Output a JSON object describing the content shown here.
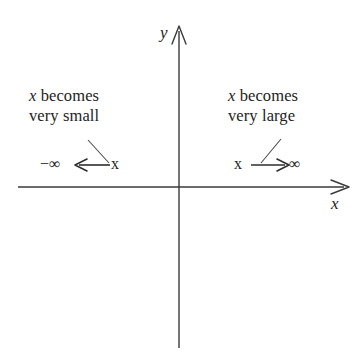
{
  "figure": {
    "type": "coordinate-axes-limit-diagram",
    "background_color": "#ffffff",
    "ink_color": "#232323"
  },
  "axes": {
    "x_axis_label": "x",
    "y_axis_label": "y",
    "origin": {
      "x": 179,
      "y": 187
    },
    "x_axis": {
      "start_x": 18,
      "end_x": 348,
      "y": 187,
      "arrowhead": "right"
    },
    "y_axis": {
      "x": 179,
      "start_y": 26,
      "end_y": 348,
      "arrowhead": "up"
    }
  },
  "annotations": {
    "left": {
      "line1_var": "x",
      "line1_rest": " becomes",
      "line2": "very small",
      "leader_line": {
        "x1": 88,
        "y1": 140,
        "x2": 109,
        "y2": 163
      }
    },
    "right": {
      "line1_var": "x",
      "line1_rest": " becomes",
      "line2": "very large",
      "leader_line": {
        "x1": 281,
        "y1": 139,
        "x2": 261,
        "y2": 163
      }
    }
  },
  "limits": {
    "left": {
      "target": "−∞",
      "variable": "x",
      "arrow_direction": "left",
      "arrow": {
        "x1": 110,
        "y1": 165,
        "x2": 76,
        "y2": 165
      }
    },
    "right": {
      "variable": "x",
      "target": "∞",
      "arrow_direction": "right",
      "arrow": {
        "x1": 252,
        "y1": 165,
        "x2": 288,
        "y2": 165
      }
    }
  }
}
